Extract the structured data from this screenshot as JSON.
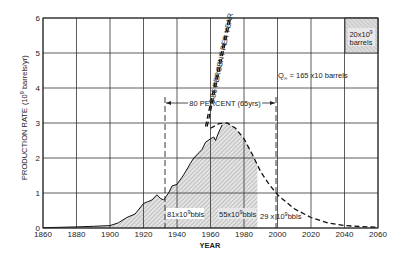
{
  "chart_data": {
    "type": "area",
    "title": "",
    "xlabel": "YEAR",
    "ylabel": "PRODUCTION RATE (10^9 barrels/yr)",
    "xlim": [
      1860,
      2060
    ],
    "ylim": [
      0,
      6
    ],
    "grid": true,
    "x_ticks": [
      "1860",
      "1880",
      "1900",
      "1920",
      "1940",
      "1960",
      "1980",
      "2000",
      "2020",
      "2040",
      "2060"
    ],
    "y_ticks": [
      "0",
      "1",
      "2",
      "3",
      "4",
      "5",
      "6"
    ],
    "series": [
      {
        "name": "Actual production",
        "style": "solid",
        "x": [
          1860,
          1870,
          1880,
          1890,
          1900,
          1905,
          1910,
          1915,
          1920,
          1925,
          1928,
          1930,
          1932,
          1935,
          1937,
          1940,
          1943,
          1945,
          1948,
          1950,
          1953,
          1955,
          1957,
          1960,
          1962,
          1963,
          1965,
          1967
        ],
        "values": [
          0.01,
          0.02,
          0.03,
          0.05,
          0.07,
          0.15,
          0.3,
          0.4,
          0.7,
          0.8,
          0.95,
          0.85,
          0.8,
          1.0,
          1.2,
          1.25,
          1.45,
          1.6,
          1.85,
          2.0,
          2.15,
          2.25,
          2.45,
          2.55,
          2.6,
          2.5,
          2.75,
          2.95
        ]
      },
      {
        "name": "Projected complete cycle",
        "style": "dashed",
        "x": [
          1960,
          1965,
          1970,
          1975,
          1980,
          1985,
          1990,
          1995,
          2000,
          2005,
          2010,
          2020,
          2030,
          2040,
          2050,
          2060
        ],
        "values": [
          2.85,
          2.98,
          3.0,
          2.85,
          2.55,
          2.1,
          1.6,
          1.25,
          0.95,
          0.75,
          0.55,
          0.3,
          0.15,
          0.07,
          0.04,
          0.02
        ]
      },
      {
        "name": "5.86 PERCENT PER YEAR",
        "style": "dashed",
        "x": [
          1957,
          1971
        ],
        "values": [
          2.9,
          6.0
        ]
      }
    ],
    "regions": [
      {
        "label": "81x10^9 bbls",
        "from": 1860,
        "to": 1934
      },
      {
        "label": "55x10^9 bbls",
        "from": 1934,
        "to": 1988
      },
      {
        "label": "29x10^9 bbls",
        "from": 1988,
        "to": 2060
      }
    ],
    "annotations": [
      {
        "text": "80 PERCENT (65yrs)",
        "from": 1934,
        "to": 1999,
        "y": 3.6
      },
      {
        "text": "Q∞ = 165 x10 barrels",
        "x": 2013,
        "y": 4.6
      },
      {
        "text": "5.86 PERCENT PER YEAR",
        "x": 1965,
        "y": 4.5
      }
    ],
    "legend": {
      "swatch": "hatched",
      "text": [
        "20x10^9",
        "barrels"
      ],
      "position": "top-right"
    }
  },
  "labels": {
    "xlabel": "YEAR",
    "ylabel_main": "PRODUCTION RATE",
    "ylabel_unit": "(10",
    "ylabel_exp": "9",
    "ylabel_unit2": " barrels/yr)",
    "legend_line1": "20x10",
    "legend_exp": "9",
    "legend_line2": "barrels",
    "q_label_pre": "Q",
    "q_label_sub": "∞",
    "q_label_post": " = 165 x10 barrels",
    "growth_label": "5.86 PERCENT PER YEAR",
    "eighty_label": "80 PERCENT (65yrs)",
    "region1_pre": "81x10",
    "region1_exp": "9",
    "region1_post": "bbls",
    "region2_pre": "55x10",
    "region2_exp": "9",
    "region2_post": "bbls",
    "region3_pre": "29 x 10",
    "region3_exp": "9",
    "region3_post": "bbls"
  }
}
